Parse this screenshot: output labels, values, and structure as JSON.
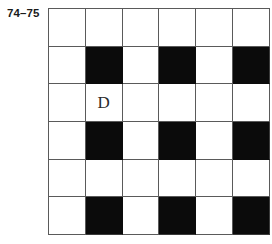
{
  "figure": {
    "label": "74–75",
    "grid": {
      "rows": 6,
      "columns": 6,
      "fill_color": "#0b0b0b",
      "empty_color": "#ffffff",
      "line_color": "#5a5a5a",
      "cells": [
        [
          {
            "filled": false,
            "letter": ""
          },
          {
            "filled": false,
            "letter": ""
          },
          {
            "filled": false,
            "letter": ""
          },
          {
            "filled": false,
            "letter": ""
          },
          {
            "filled": false,
            "letter": ""
          },
          {
            "filled": false,
            "letter": ""
          }
        ],
        [
          {
            "filled": false,
            "letter": ""
          },
          {
            "filled": true,
            "letter": ""
          },
          {
            "filled": false,
            "letter": ""
          },
          {
            "filled": true,
            "letter": ""
          },
          {
            "filled": false,
            "letter": ""
          },
          {
            "filled": true,
            "letter": ""
          }
        ],
        [
          {
            "filled": false,
            "letter": ""
          },
          {
            "filled": false,
            "letter": "D"
          },
          {
            "filled": false,
            "letter": ""
          },
          {
            "filled": false,
            "letter": ""
          },
          {
            "filled": false,
            "letter": ""
          },
          {
            "filled": false,
            "letter": ""
          }
        ],
        [
          {
            "filled": false,
            "letter": ""
          },
          {
            "filled": true,
            "letter": ""
          },
          {
            "filled": false,
            "letter": ""
          },
          {
            "filled": true,
            "letter": ""
          },
          {
            "filled": false,
            "letter": ""
          },
          {
            "filled": true,
            "letter": ""
          }
        ],
        [
          {
            "filled": false,
            "letter": ""
          },
          {
            "filled": false,
            "letter": ""
          },
          {
            "filled": false,
            "letter": ""
          },
          {
            "filled": false,
            "letter": ""
          },
          {
            "filled": false,
            "letter": ""
          },
          {
            "filled": false,
            "letter": ""
          }
        ],
        [
          {
            "filled": false,
            "letter": ""
          },
          {
            "filled": true,
            "letter": ""
          },
          {
            "filled": false,
            "letter": ""
          },
          {
            "filled": true,
            "letter": ""
          },
          {
            "filled": false,
            "letter": ""
          },
          {
            "filled": true,
            "letter": ""
          }
        ]
      ]
    }
  }
}
